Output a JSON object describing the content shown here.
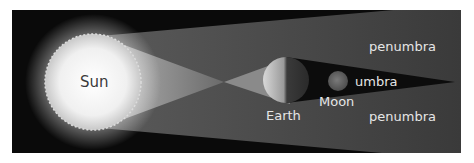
{
  "diagram": {
    "labels": {
      "sun": "Sun",
      "earth": "Earth",
      "moon": "Moon",
      "umbra": "umbra",
      "penumbra_top": "penumbra",
      "penumbra_bottom": "penumbra"
    },
    "colors": {
      "background": "#0a0a0a",
      "page": "#ffffff",
      "penumbra": "#4a4a4a",
      "umbra": "#0c0c0c",
      "sun_core": "#ffffff",
      "sun_edge": "#cfcfcf",
      "label": "#e6e6e6",
      "sun_label": "#3a3a3a"
    },
    "bodies": [
      {
        "name": "Sun",
        "cx": 93,
        "cy": 82,
        "r": 48
      },
      {
        "name": "Earth",
        "cx": 286,
        "cy": 80,
        "r": 23
      },
      {
        "name": "Moon",
        "cx": 338,
        "cy": 81,
        "r": 10
      }
    ]
  }
}
